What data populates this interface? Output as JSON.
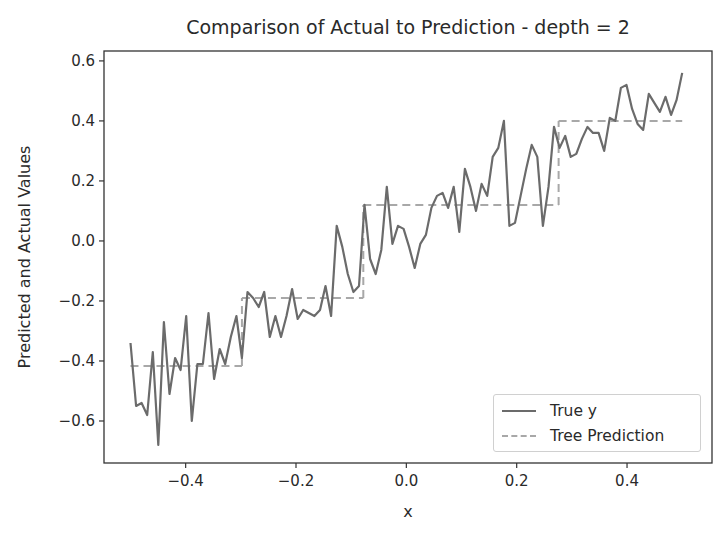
{
  "chart_data": {
    "type": "line",
    "title": "Comparison of Actual to Prediction - depth = 2",
    "xlabel": "x",
    "ylabel": "Predicted and Actual Values",
    "xlim": [
      -0.548,
      0.554
    ],
    "ylim": [
      -0.74,
      0.633
    ],
    "x_ticks": [
      -0.4,
      -0.2,
      0.0,
      0.2,
      0.4
    ],
    "x_tick_labels": [
      "−0.4",
      "−0.2",
      "0.0",
      "0.2",
      "0.4"
    ],
    "y_ticks": [
      -0.6,
      -0.4,
      -0.2,
      0.0,
      0.2,
      0.4,
      0.6
    ],
    "y_tick_labels": [
      "−0.6",
      "−0.4",
      "−0.2",
      "0.0",
      "0.2",
      "0.4",
      "0.6"
    ],
    "grid": false,
    "legend_position": "lower right",
    "series": [
      {
        "name": "True y",
        "style": "solid",
        "color": "#6b6b6b",
        "x_start": -0.5,
        "x_end": 0.5,
        "values": [
          -0.34,
          -0.55,
          -0.54,
          -0.58,
          -0.37,
          -0.68,
          -0.27,
          -0.51,
          -0.39,
          -0.43,
          -0.25,
          -0.6,
          -0.41,
          -0.41,
          -0.24,
          -0.46,
          -0.36,
          -0.41,
          -0.32,
          -0.25,
          -0.39,
          -0.17,
          -0.19,
          -0.22,
          -0.17,
          -0.32,
          -0.25,
          -0.32,
          -0.25,
          -0.16,
          -0.26,
          -0.23,
          -0.24,
          -0.25,
          -0.23,
          -0.15,
          -0.25,
          0.05,
          -0.02,
          -0.11,
          -0.17,
          -0.15,
          0.12,
          -0.06,
          -0.11,
          -0.03,
          0.18,
          -0.01,
          0.05,
          0.04,
          -0.02,
          -0.09,
          -0.01,
          0.02,
          0.11,
          0.15,
          0.16,
          0.11,
          0.18,
          0.03,
          0.24,
          0.18,
          0.1,
          0.19,
          0.15,
          0.28,
          0.31,
          0.4,
          0.05,
          0.06,
          0.15,
          0.24,
          0.32,
          0.28,
          0.05,
          0.18,
          0.38,
          0.31,
          0.35,
          0.28,
          0.29,
          0.34,
          0.38,
          0.36,
          0.36,
          0.3,
          0.41,
          0.4,
          0.51,
          0.52,
          0.44,
          0.39,
          0.37,
          0.49,
          0.46,
          0.43,
          0.48,
          0.42,
          0.47,
          0.56
        ]
      },
      {
        "name": "Tree Prediction",
        "style": "dashed",
        "color": "#a8a8a8",
        "segments": [
          {
            "x0": -0.5,
            "x1": -0.298,
            "y": -0.417
          },
          {
            "x0": -0.298,
            "x1": -0.078,
            "y": -0.19
          },
          {
            "x0": -0.078,
            "x1": 0.276,
            "y": 0.12
          },
          {
            "x0": 0.276,
            "x1": 0.5,
            "y": 0.4
          }
        ]
      }
    ]
  },
  "legend": {
    "items": [
      {
        "label": "True y"
      },
      {
        "label": "Tree Prediction"
      }
    ]
  }
}
